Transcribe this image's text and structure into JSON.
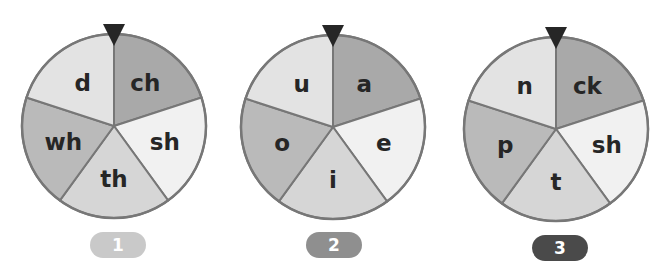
{
  "colors": {
    "outline": "#777777",
    "pointer": "#262626",
    "label": "#262626",
    "segment_upper_right": "#a9a9a9",
    "segment_right": "#f1f1f1",
    "segment_bottom": "#d6d6d6",
    "segment_left": "#bababa",
    "segment_upper_left": "#e3e3e3"
  },
  "spinners": [
    {
      "number": "1",
      "badge_color": "#c9c9c9",
      "segments": [
        "ch",
        "sh",
        "th",
        "wh",
        "d"
      ]
    },
    {
      "number": "2",
      "badge_color": "#8f8f8f",
      "segments": [
        "a",
        "e",
        "i",
        "o",
        "u"
      ]
    },
    {
      "number": "3",
      "badge_color": "#4a4a4a",
      "segments": [
        "ck",
        "sh",
        "t",
        "p",
        "n"
      ]
    }
  ]
}
